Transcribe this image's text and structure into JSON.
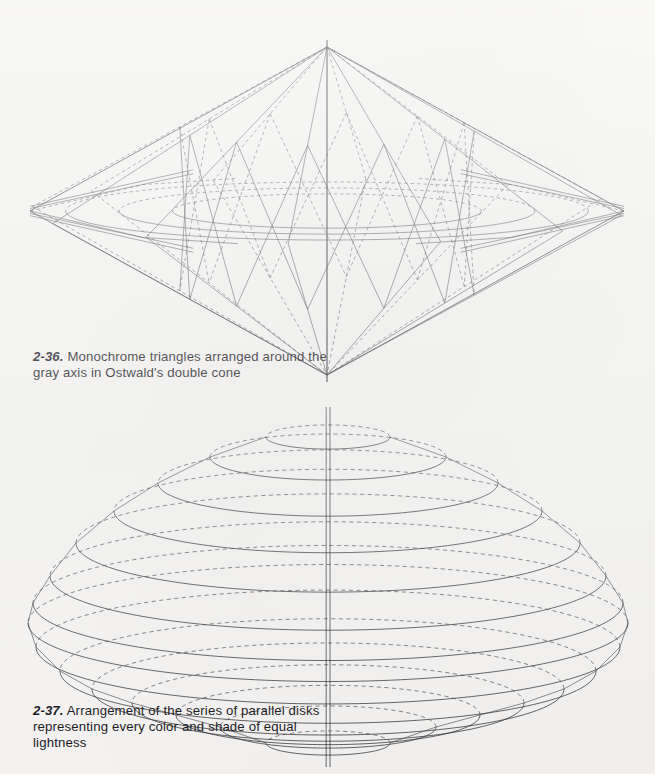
{
  "page": {
    "background_color": "#f5f4f2",
    "ink_color": "#2b2b33",
    "width": 655,
    "height": 774
  },
  "figures": [
    {
      "id": "2-36",
      "name": "ostwald-double-cone",
      "caption_number": "2-36.",
      "caption_text": "Monochrome triangles arranged around the gray axis in Ostwald's double cone",
      "geometry": {
        "type": "double-cone-wireframe",
        "apex_top": {
          "x": 327,
          "y": 47
        },
        "apex_bottom": {
          "x": 327,
          "y": 375
        },
        "equator_center": {
          "x": 327,
          "y": 211
        },
        "equator_radius_x": 297,
        "equator_radius_y": 33,
        "triangle_count": 12,
        "axis_color": "#1b1b22"
      }
    },
    {
      "id": "2-37",
      "name": "parallel-disks-stack",
      "caption_number": "2-37.",
      "caption_text": "Arrangement of the series of parallel disks representing every color and shade of equal lightness",
      "geometry": {
        "type": "stacked-ellipse-disks",
        "axis_x": 328,
        "axis_top_y": 407,
        "axis_bottom_y": 765,
        "center_y": 600,
        "max_radius_x": 300,
        "ellipse_flatten": 0.195,
        "disk_count": 15,
        "solid_front_dashed_back": true
      }
    }
  ],
  "chart_data": {
    "type": "diagram",
    "panels": [
      {
        "label": "2-36",
        "description": "Monochrome triangles arranged around the gray axis in Ostwald's double cone",
        "element_counts": {
          "radial_triangles": 12,
          "vertical_axis": 1
        }
      },
      {
        "label": "2-37",
        "description": "Series of parallel disks representing every color and shade of equal lightness",
        "element_counts": {
          "disks": 15,
          "vertical_axis": 1
        }
      }
    ]
  }
}
